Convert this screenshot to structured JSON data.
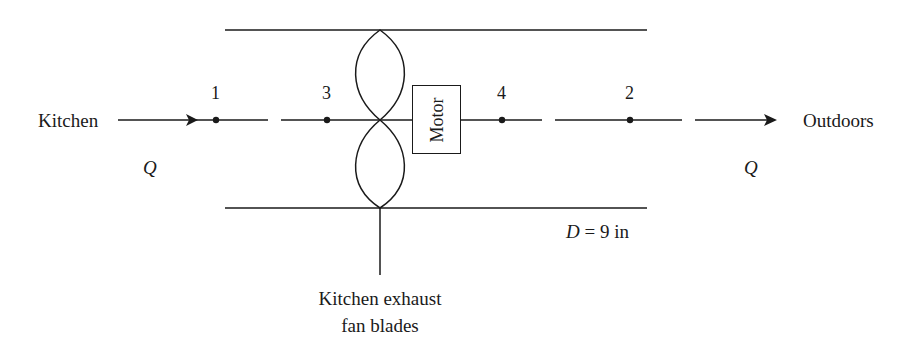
{
  "diagram": {
    "type": "fan-duct schematic",
    "inlet_label": "Kitchen",
    "outlet_label": "Outdoors",
    "flow_symbol_left": "Q",
    "flow_symbol_right": "Q",
    "points": [
      {
        "id": "1",
        "label": "1"
      },
      {
        "id": "3",
        "label": "3"
      },
      {
        "id": "4",
        "label": "4"
      },
      {
        "id": "2",
        "label": "2"
      }
    ],
    "motor_label": "Motor",
    "diameter_label_var": "D",
    "diameter_label_value": "= 9 in",
    "fan_caption_line1": "Kitchen exhaust",
    "fan_caption_line2": "fan blades",
    "colors": {
      "line": "#1a1a1a",
      "background": "#ffffff"
    }
  }
}
